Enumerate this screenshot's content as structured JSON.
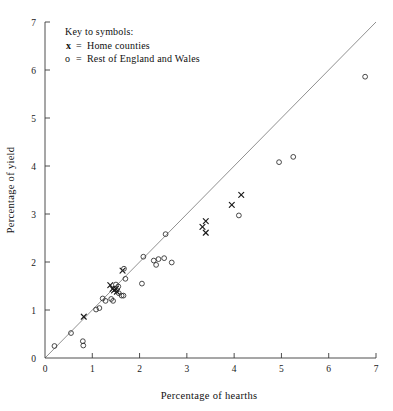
{
  "chart_data": {
    "type": "scatter",
    "title": "",
    "xlabel": "Percentage of hearths",
    "ylabel": "Percentage of yield",
    "xlim": [
      0,
      7
    ],
    "ylim": [
      0,
      7
    ],
    "xticks": [
      "0",
      "1",
      "2",
      "3",
      "4",
      "5",
      "6",
      "7"
    ],
    "yticks": [
      "0",
      "1",
      "2",
      "3",
      "4",
      "5",
      "6",
      "7"
    ],
    "grid": false,
    "legend_position": "top-left",
    "annotations": [
      {
        "text": "Key to symbols:"
      }
    ],
    "reference_line": {
      "description": "y = x diagonal",
      "from": [
        0,
        0
      ],
      "to": [
        7,
        7
      ]
    },
    "series": [
      {
        "name": "Home counties",
        "symbol": "x",
        "legend_label": "x  =  Home counties",
        "color": "#1a1a1a",
        "points": [
          [
            0.82,
            0.86
          ],
          [
            1.38,
            1.52
          ],
          [
            1.43,
            1.44
          ],
          [
            1.46,
            1.41
          ],
          [
            1.5,
            1.44
          ],
          [
            1.52,
            1.38
          ],
          [
            1.64,
            1.82
          ],
          [
            3.33,
            2.73
          ],
          [
            3.4,
            2.85
          ],
          [
            3.4,
            2.61
          ],
          [
            3.95,
            3.19
          ],
          [
            4.15,
            3.4
          ]
        ]
      },
      {
        "name": "Rest of England and Wales",
        "symbol": "o",
        "legend_label": "o  =  Rest of England and Wales",
        "color": "#2b2b2b",
        "points": [
          [
            0.2,
            0.25
          ],
          [
            0.55,
            0.52
          ],
          [
            0.8,
            0.35
          ],
          [
            0.81,
            0.26
          ],
          [
            1.08,
            1.01
          ],
          [
            1.15,
            1.04
          ],
          [
            1.22,
            1.24
          ],
          [
            1.28,
            1.19
          ],
          [
            1.4,
            1.23
          ],
          [
            1.44,
            1.19
          ],
          [
            1.5,
            1.53
          ],
          [
            1.55,
            1.49
          ],
          [
            1.56,
            1.35
          ],
          [
            1.62,
            1.3
          ],
          [
            1.66,
            1.3
          ],
          [
            1.67,
            1.86
          ],
          [
            1.7,
            1.65
          ],
          [
            2.05,
            1.55
          ],
          [
            2.08,
            2.11
          ],
          [
            2.3,
            2.03
          ],
          [
            2.35,
            1.94
          ],
          [
            2.4,
            2.06
          ],
          [
            2.52,
            2.08
          ],
          [
            2.55,
            2.58
          ],
          [
            2.68,
            1.99
          ],
          [
            4.1,
            2.97
          ],
          [
            4.95,
            4.08
          ],
          [
            5.25,
            4.19
          ],
          [
            6.77,
            5.86
          ]
        ]
      }
    ]
  },
  "legend": {
    "heading": "Key to symbols:",
    "entries": [
      {
        "symbol": "x",
        "equals": "=",
        "label": "Home counties"
      },
      {
        "symbol": "o",
        "equals": "=",
        "label": "Rest of England and Wales"
      }
    ]
  },
  "axes": {
    "x_title": "Percentage of hearths",
    "y_title": "Percentage of yield"
  }
}
